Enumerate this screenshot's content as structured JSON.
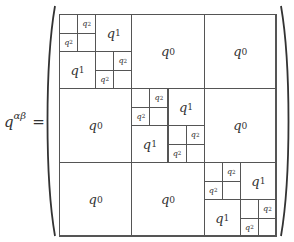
{
  "equation": {
    "lhs_base": "q",
    "lhs_superscript": "αβ",
    "equals": "="
  },
  "matrix": {
    "description": "Parisi hierarchical matrix, 3 diagonal blocks",
    "labels": {
      "q0": {
        "base": "q",
        "sub": "0"
      },
      "q1": {
        "base": "q",
        "sub": "1"
      },
      "q2": {
        "base": "q",
        "sub": "2"
      }
    },
    "blocks_per_side": 3,
    "off_diagonal_label": "q0",
    "diagonal_block": {
      "sub_blocks": [
        [
          "q2-sub",
          "q1"
        ],
        [
          "q1",
          "q2-sub"
        ]
      ],
      "q2_sub": [
        [
          "",
          "q2"
        ],
        [
          "q2",
          ""
        ]
      ]
    }
  }
}
